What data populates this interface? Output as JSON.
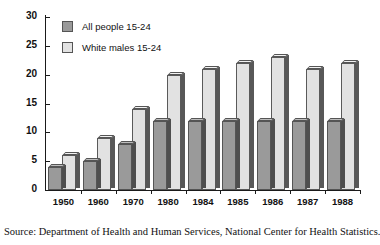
{
  "chart_data": {
    "type": "bar",
    "title": "",
    "subtitle": "",
    "xlabel": "",
    "ylabel": "",
    "categories": [
      "1950",
      "1960",
      "1970",
      "1980",
      "1984",
      "1985",
      "1986",
      "1987",
      "1988"
    ],
    "series": [
      {
        "name": "All people 15-24",
        "color": "#9a9a9a",
        "values": [
          4,
          5,
          8,
          12,
          12,
          12,
          12,
          12,
          12
        ]
      },
      {
        "name": "White males 15-24",
        "color": "#e2e2e2",
        "values": [
          6,
          9,
          14,
          20,
          21,
          22,
          23,
          21,
          22
        ]
      }
    ],
    "ylim": [
      0,
      30
    ],
    "ytick_values": [
      30,
      25,
      20,
      15,
      10,
      5,
      0
    ],
    "ytick_labels": [
      "30",
      "25",
      "20",
      "15",
      "10",
      "5",
      "0"
    ],
    "grid": false,
    "legend_position": "top-left",
    "style": "3d-bars"
  },
  "legend": {
    "items": [
      {
        "label": "All people 15-24",
        "swatch": "#9a9a9a"
      },
      {
        "label": "White males 15-24",
        "swatch": "#e2e2e2"
      }
    ]
  },
  "source": {
    "text": "Source: Department of Health and Human Services, National Center for Health Statistics."
  }
}
